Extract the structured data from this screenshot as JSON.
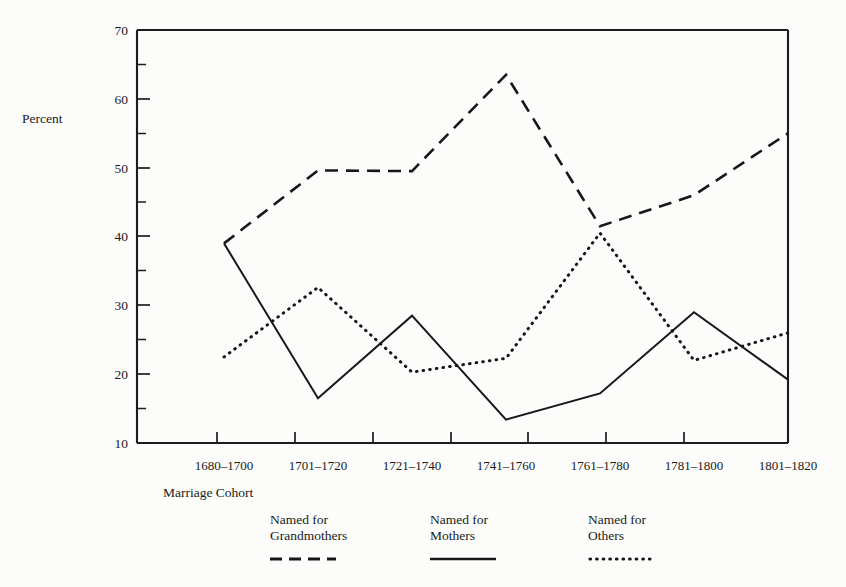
{
  "chart_data": {
    "type": "line",
    "title": "",
    "xlabel": "Marriage Cohort",
    "ylabel": "Percent",
    "categories": [
      "1680–1700",
      "1701–1720",
      "1721–1740",
      "1741–1760",
      "1761–1780",
      "1781–1800",
      "1801–1820"
    ],
    "series": [
      {
        "name": "Named for Grandmothers",
        "style": "dashed",
        "values": [
          39.0,
          49.6,
          49.5,
          63.5,
          41.5,
          46.0,
          55.0
        ]
      },
      {
        "name": "Named for Mothers",
        "style": "solid",
        "values": [
          39.0,
          16.5,
          28.5,
          13.4,
          17.2,
          29.0,
          19.2
        ]
      },
      {
        "name": "Named for Others",
        "style": "dotted",
        "values": [
          22.5,
          32.6,
          20.3,
          22.3,
          40.5,
          22.0,
          26.0
        ]
      }
    ],
    "ylim": [
      10,
      70
    ],
    "yticks": [
      10,
      20,
      30,
      40,
      50,
      60,
      70
    ],
    "ytick_labels": [
      "10",
      "20",
      "30",
      "40",
      "50",
      "60",
      "70"
    ],
    "yminor_ticks": [
      15,
      25,
      35,
      45,
      55,
      65
    ],
    "grid": false,
    "legend_position": "below",
    "legend": [
      {
        "line1": "Named for",
        "line2": "Grandmothers",
        "style": "dashed"
      },
      {
        "line1": "Named for",
        "line2": "Mothers",
        "style": "solid"
      },
      {
        "line1": "Named for",
        "line2": "Others",
        "style": "dotted"
      }
    ],
    "colors": {
      "line": "#17171a",
      "axis": "#1c1c1c",
      "background": "#fcfcfa"
    }
  }
}
